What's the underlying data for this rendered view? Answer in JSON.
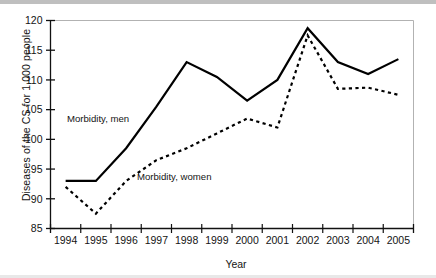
{
  "figure": {
    "ylabel": "Diseases of the CS for 1,000 people",
    "xlabel": "Year"
  },
  "annotations": {
    "men": "Morbidity, men",
    "women": "Morbidity, women"
  },
  "yticks": [
    "85",
    "90",
    "95",
    "100",
    "105",
    "110",
    "115",
    "120"
  ],
  "xticks": [
    "1994",
    "1995",
    "1996",
    "1997",
    "1998",
    "1999",
    "2000",
    "2001",
    "2002",
    "2003",
    "2004",
    "2005"
  ],
  "chart_data": {
    "type": "line",
    "title": "",
    "xlabel": "Year",
    "ylabel": "Diseases of the CS for 1,000 people",
    "x": [
      1994,
      1995,
      1996,
      1997,
      1998,
      1999,
      2000,
      2001,
      2002,
      2003,
      2004,
      2005
    ],
    "categories": [
      "1994",
      "1995",
      "1996",
      "1997",
      "1998",
      "1999",
      "2000",
      "2001",
      "2002",
      "2003",
      "2004",
      "2005"
    ],
    "ylim": [
      85,
      120
    ],
    "ytick_step": 5,
    "grid": false,
    "legend": "inline-annotations",
    "series": [
      {
        "name": "Morbidity, men",
        "style": "solid",
        "color": "#000000",
        "values": [
          93,
          93,
          98.5,
          105.5,
          113,
          110.5,
          106.5,
          110,
          118.7,
          113,
          111,
          113.5
        ]
      },
      {
        "name": "Morbidity, women",
        "style": "dashed",
        "color": "#000000",
        "values": [
          92,
          87.5,
          93,
          96.5,
          98.5,
          101,
          103.5,
          102,
          117.5,
          108.5,
          108.7,
          107.5
        ]
      }
    ]
  }
}
